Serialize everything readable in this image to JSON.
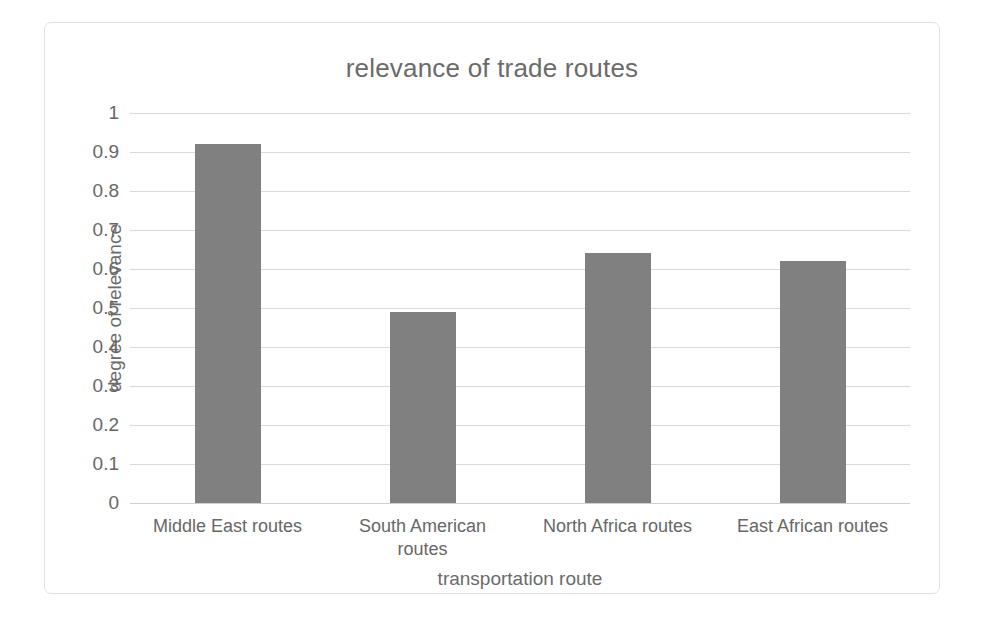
{
  "chart_data": {
    "type": "bar",
    "title": "relevance of trade routes",
    "xlabel": "transportation route",
    "ylabel": "degree of relevance",
    "categories": [
      "Middle East routes",
      "South American routes",
      "North Africa routes",
      "East African routes"
    ],
    "values": [
      0.92,
      0.49,
      0.64,
      0.62
    ],
    "ylim": [
      0,
      1
    ],
    "ytick_labels": [
      "1",
      "0.9",
      "0.8",
      "0.7",
      "0.6",
      "0.5",
      "0.4",
      "0.3",
      "0.2",
      "0.1",
      "0"
    ],
    "ytick_values": [
      1,
      0.9,
      0.8,
      0.7,
      0.6,
      0.5,
      0.4,
      0.3,
      0.2,
      0.1,
      0
    ],
    "grid": "horizontal",
    "legend": "none",
    "bar_color": "#808080",
    "grid_color": "#d9d9d9",
    "text_color": "#676767",
    "border_color": "#e2e2e2"
  }
}
